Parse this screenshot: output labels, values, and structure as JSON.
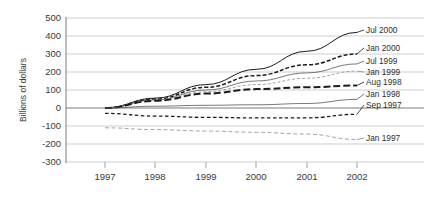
{
  "chart_data": {
    "type": "line",
    "title": "",
    "xlabel": "",
    "ylabel": "Billions of dollars",
    "x": [
      1997,
      1998,
      1999,
      2000,
      2001,
      2002
    ],
    "xtick_labels": [
      "1997",
      "1998",
      "1999",
      "2000",
      "2001",
      "2002"
    ],
    "ytick_labels": [
      "500",
      "400",
      "300",
      "200",
      "100",
      "0",
      "-100",
      "-200",
      "-300"
    ],
    "yticks": [
      500,
      400,
      300,
      200,
      100,
      0,
      -100,
      -200,
      -300
    ],
    "ylim": [
      -300,
      500
    ],
    "xlim": [
      1997,
      2002
    ],
    "grid": true,
    "legend_position": "right",
    "series": [
      {
        "name": "Jul 2000",
        "style": "solid",
        "values": [
          0,
          55,
          130,
          215,
          315,
          420
        ]
      },
      {
        "name": "Jan 2000",
        "style": "dashed",
        "values": [
          0,
          50,
          115,
          180,
          240,
          300
        ]
      },
      {
        "name": "Jul 1999",
        "style": "thin-solid",
        "values": [
          0,
          45,
          100,
          150,
          195,
          245
        ]
      },
      {
        "name": "Jan 1999",
        "style": "fine-dash",
        "values": [
          0,
          42,
          90,
          130,
          165,
          205
        ]
      },
      {
        "name": "Aug 1998",
        "style": "long-dash",
        "values": [
          0,
          40,
          80,
          105,
          115,
          125
        ]
      },
      {
        "name": "Jan 1998",
        "style": "thin-solid",
        "values": [
          0,
          10,
          15,
          18,
          25,
          48
        ]
      },
      {
        "name": "Sep 1997",
        "style": "med-dash",
        "values": [
          -30,
          -45,
          -52,
          -55,
          -55,
          -35
        ]
      },
      {
        "name": "Jan 1997",
        "style": "dot-dash",
        "values": [
          -110,
          -120,
          -128,
          -135,
          -145,
          -175
        ]
      }
    ]
  },
  "legend": {
    "entries": [
      {
        "label": "Jul 2000"
      },
      {
        "label": "Jan 2000"
      },
      {
        "label": "Jul 1999"
      },
      {
        "label": "Jan 1999"
      },
      {
        "label": "Aug 1998"
      },
      {
        "label": "Jan 1998"
      },
      {
        "label": "Sep 1997"
      },
      {
        "label": "Jan 1997"
      }
    ]
  },
  "colors": {
    "grid": "#b9b9b9",
    "axis": "#6b6b6b",
    "line_dark": "#1c1c1c",
    "line_mid": "#555555",
    "line_light": "#8d8d8d",
    "text": "#3a3a3a",
    "background": "#ffffff"
  }
}
